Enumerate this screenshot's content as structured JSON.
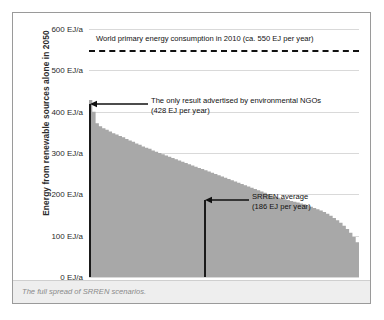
{
  "figure": {
    "caption": "The full spread of SRREN scenarios.",
    "y_axis_title": "Energy from renewable sources alone in 2050",
    "frame_color": "#9a9a9a",
    "area_fill_color": "#a8a8a8",
    "gridline_color": "#d9d9d9",
    "marker_line_color": "#1a1a1a"
  },
  "annotations": {
    "world_consumption": {
      "label": "World primary energy consumption in 2010 (ca. 550 EJ per year)",
      "value": 550,
      "unit": "EJ per year",
      "style": "dashed-horizontal-line"
    },
    "ngo_result": {
      "line1": "The only result advertised by environmental NGOs",
      "line2": "(428 EJ per year)",
      "value": 428,
      "unit": "EJ per year",
      "style": "vertical-line-with-left-arrow"
    },
    "srren_average": {
      "line1": "SRREN average",
      "line2": "(186 EJ per year)",
      "value": 186,
      "unit": "EJ per year",
      "style": "vertical-line-with-left-arrow"
    }
  },
  "chart_data": {
    "type": "area",
    "title": "",
    "subtitle": "",
    "xlabel": "",
    "ylabel": "Energy from renewable sources alone in 2050",
    "ylim": [
      0,
      600
    ],
    "xlim": [
      0,
      164
    ],
    "grid": true,
    "legend": null,
    "y_tick_labels": [
      "600 EJ/a",
      "500 EJ/a",
      "400 EJ/a",
      "300 EJ/a",
      "200 EJ/a",
      "100 EJ/a",
      "0 EJ/a"
    ],
    "y_ticks": [
      600,
      500,
      400,
      300,
      200,
      100,
      0
    ],
    "x_tick_labels": [],
    "series": [
      {
        "name": "SRREN scenarios (sorted descending)",
        "description": "Renewable energy supply in 2050 across the full spread of SRREN scenarios, sorted from highest to lowest.",
        "x": [
          0,
          2,
          4,
          6,
          8,
          10,
          12,
          14,
          16,
          18,
          20,
          22,
          24,
          26,
          28,
          30,
          32,
          34,
          36,
          38,
          40,
          42,
          44,
          46,
          48,
          50,
          52,
          54,
          56,
          58,
          60,
          62,
          64,
          66,
          68,
          70,
          72,
          74,
          76,
          78,
          80,
          82,
          84,
          86,
          88,
          90,
          92,
          94,
          96,
          98,
          100,
          102,
          104,
          106,
          108,
          110,
          112,
          114,
          116,
          118,
          120,
          122,
          124,
          126,
          128,
          130,
          132,
          134,
          136,
          138,
          140,
          142,
          144,
          146,
          148,
          150,
          152,
          154,
          156,
          158,
          160,
          162,
          164
        ],
        "values": [
          428,
          400,
          372,
          365,
          360,
          356,
          352,
          348,
          345,
          341,
          338,
          334,
          330,
          327,
          323,
          320,
          316,
          313,
          310,
          306,
          303,
          300,
          297,
          294,
          291,
          288,
          285,
          282,
          279,
          276,
          273,
          270,
          267,
          264,
          261,
          258,
          255,
          252,
          249,
          246,
          243,
          240,
          237,
          234,
          231,
          228,
          225,
          222,
          219,
          216,
          213,
          210,
          207,
          204,
          200,
          197,
          194,
          192,
          190,
          188,
          186,
          184,
          182,
          180,
          178,
          176,
          173,
          170,
          167,
          164,
          161,
          157,
          153,
          148,
          143,
          137,
          131,
          124,
          116,
          107,
          97,
          84,
          60
        ]
      }
    ],
    "reference_lines": [
      {
        "type": "horizontal",
        "value": 550,
        "label": "World primary energy consumption in 2010 (ca. 550 EJ per year)",
        "style": "dashed"
      },
      {
        "type": "vertical",
        "at_x": 0,
        "label": "The only result advertised by environmental NGOs (428 EJ per year)",
        "style": "solid"
      },
      {
        "type": "vertical",
        "at_x": 70,
        "label": "SRREN average (186 EJ per year)",
        "style": "solid"
      }
    ]
  }
}
